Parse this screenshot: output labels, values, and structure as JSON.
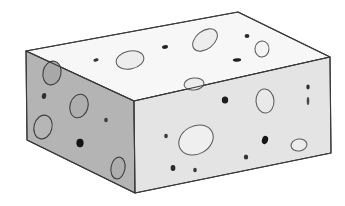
{
  "image": {
    "title": "Swiss cheese block",
    "subject": "3d-cheese-block-illustration",
    "style": "line-drawing-with-flat-shading",
    "background_color": "#ffffff",
    "canvas": {
      "width": 345,
      "height": 206
    }
  },
  "palette": {
    "outline": "#3a3a3a",
    "top_face": "#f7f7f7",
    "left_face": "#b4b4b4",
    "front_face": "#e4e4e4",
    "hole_ring": "#5c5c5c",
    "hole_fill_top": "#ededed",
    "hole_fill_left": "#a8a8a8",
    "hole_fill_front": "#efefef",
    "speck_dark": "#1a1a1a",
    "speck_mid": "#555555"
  },
  "geometry": {
    "vertices": {
      "top_back_apex": [
        238,
        12
      ],
      "top_left": [
        26,
        51
      ],
      "top_right": [
        330,
        57
      ],
      "top_front": [
        134,
        101
      ],
      "bottom_left": [
        27,
        140
      ],
      "bottom_front": [
        135,
        193
      ],
      "bottom_right": [
        331,
        153
      ]
    },
    "faces": [
      {
        "name": "top-face",
        "label": "Top face",
        "fill": "#f7f7f7",
        "points": "238,12 330,57 134,101 26,51"
      },
      {
        "name": "left-face",
        "label": "Left side face",
        "fill": "#b4b4b4",
        "points": "26,51 134,101 135,193 27,140"
      },
      {
        "name": "front-face",
        "label": "Front right face",
        "fill": "#e4e4e4",
        "points": "134,101 330,57 331,153 135,193"
      }
    ]
  },
  "holes": {
    "top_face": [
      {
        "name": "hole-top-1",
        "cx": 130,
        "cy": 60,
        "rx": 14,
        "ry": 9,
        "rot": -12,
        "kind": "ring",
        "fill": "#ededed"
      },
      {
        "name": "hole-top-2",
        "cx": 205,
        "cy": 40,
        "rx": 14,
        "ry": 9,
        "rot": -38,
        "kind": "ring",
        "fill": "#ededed"
      },
      {
        "name": "hole-top-3",
        "cx": 262,
        "cy": 49,
        "rx": 7,
        "ry": 8,
        "rot": 5,
        "kind": "ring",
        "fill": "#f4f4f4"
      },
      {
        "name": "hole-top-4",
        "cx": 194,
        "cy": 84,
        "rx": 10,
        "ry": 6,
        "rot": -6,
        "kind": "ring",
        "fill": "#ececec"
      },
      {
        "name": "speck-top-1",
        "cx": 165,
        "cy": 47,
        "rx": 3,
        "ry": 1.8,
        "rot": -10,
        "kind": "speck",
        "fill": "#222222"
      },
      {
        "name": "speck-top-2",
        "cx": 96,
        "cy": 60,
        "rx": 2.6,
        "ry": 1.6,
        "rot": -10,
        "kind": "speck",
        "fill": "#333333"
      },
      {
        "name": "speck-top-3",
        "cx": 247,
        "cy": 36,
        "rx": 2.4,
        "ry": 2.0,
        "rot": 0,
        "kind": "speck",
        "fill": "#2a2a2a"
      },
      {
        "name": "speck-top-4",
        "cx": 237,
        "cy": 60,
        "rx": 4.2,
        "ry": 1.7,
        "rot": -4,
        "kind": "speck",
        "fill": "#1f1f1f"
      }
    ],
    "left_face": [
      {
        "name": "hole-left-1",
        "cx": 52,
        "cy": 73,
        "rx": 9,
        "ry": 12,
        "rot": 12,
        "kind": "ring-dark",
        "fill": "#a8a8a8"
      },
      {
        "name": "hole-left-2",
        "cx": 79,
        "cy": 106,
        "rx": 9,
        "ry": 12,
        "rot": 16,
        "kind": "ring-dark",
        "fill": "#aeaeae"
      },
      {
        "name": "hole-left-3",
        "cx": 43,
        "cy": 127,
        "rx": 9,
        "ry": 12,
        "rot": 14,
        "kind": "ring-dark",
        "fill": "#b6b6b6"
      },
      {
        "name": "hole-left-4",
        "cx": 118,
        "cy": 168,
        "rx": 7,
        "ry": 11,
        "rot": 10,
        "kind": "ring-dark",
        "fill": "#adadad"
      },
      {
        "name": "speck-left-1",
        "cx": 44,
        "cy": 96,
        "rx": 2.2,
        "ry": 3.0,
        "rot": 10,
        "kind": "speck",
        "fill": "#2f2f2f"
      },
      {
        "name": "speck-left-2",
        "cx": 106,
        "cy": 120,
        "rx": 1.8,
        "ry": 2.2,
        "rot": 0,
        "kind": "speck",
        "fill": "#3c3c3c"
      },
      {
        "name": "speck-left-3",
        "cx": 80,
        "cy": 143,
        "rx": 3.6,
        "ry": 4.2,
        "rot": 0,
        "kind": "speck",
        "fill": "#141414"
      }
    ],
    "front_face": [
      {
        "name": "hole-front-1",
        "cx": 196,
        "cy": 140,
        "rx": 18,
        "ry": 14,
        "rot": -28,
        "kind": "ring",
        "fill": "#efefef"
      },
      {
        "name": "hole-front-2",
        "cx": 265,
        "cy": 101,
        "rx": 9,
        "ry": 12,
        "rot": -4,
        "kind": "ring",
        "fill": "#e9e9e9"
      },
      {
        "name": "hole-front-3",
        "cx": 299,
        "cy": 145,
        "rx": 8,
        "ry": 6,
        "rot": -8,
        "kind": "ring",
        "fill": "#ececec"
      },
      {
        "name": "speck-front-1",
        "cx": 225,
        "cy": 100,
        "rx": 3.2,
        "ry": 3.6,
        "rot": 0,
        "kind": "speck",
        "fill": "#1c1c1c"
      },
      {
        "name": "speck-front-2",
        "cx": 166,
        "cy": 136,
        "rx": 1.8,
        "ry": 2.2,
        "rot": 0,
        "kind": "speck",
        "fill": "#3a3a3a"
      },
      {
        "name": "speck-front-3",
        "cx": 173,
        "cy": 168,
        "rx": 2.4,
        "ry": 3.0,
        "rot": 0,
        "kind": "speck",
        "fill": "#2b2b2b"
      },
      {
        "name": "speck-front-4",
        "cx": 195,
        "cy": 170,
        "rx": 1.8,
        "ry": 2.2,
        "rot": 0,
        "kind": "speck",
        "fill": "#3a3a3a"
      },
      {
        "name": "speck-front-5",
        "cx": 265,
        "cy": 140,
        "rx": 3.0,
        "ry": 4.2,
        "rot": 18,
        "kind": "speck",
        "fill": "#151515"
      },
      {
        "name": "speck-front-6",
        "cx": 246,
        "cy": 157,
        "rx": 2.2,
        "ry": 2.6,
        "rot": 0,
        "kind": "speck",
        "fill": "#343434"
      },
      {
        "name": "speck-front-7",
        "cx": 308,
        "cy": 87,
        "rx": 1.7,
        "ry": 2.4,
        "rot": 0,
        "kind": "speck",
        "fill": "#2e2e2e"
      },
      {
        "name": "speck-front-8",
        "cx": 308,
        "cy": 101,
        "rx": 1.3,
        "ry": 4.0,
        "rot": 0,
        "kind": "speck",
        "fill": "#4a4a4a"
      }
    ]
  }
}
